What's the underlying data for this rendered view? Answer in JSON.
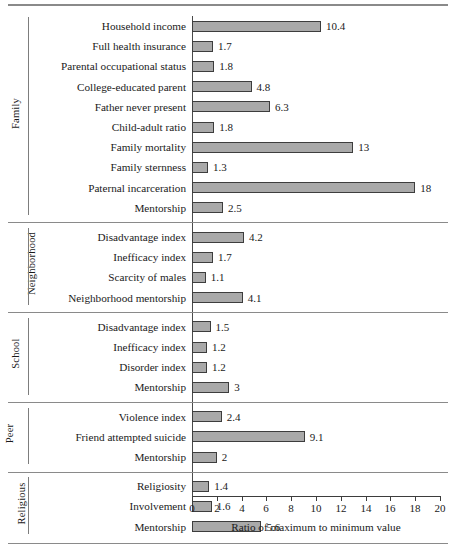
{
  "chart_data": {
    "type": "bar",
    "orientation": "horizontal",
    "title": "",
    "xlabel": "Ratio of maximum to minimum value",
    "ylabel": "",
    "xlim": [
      0,
      20
    ],
    "xticks": [
      0,
      2,
      4,
      6,
      8,
      10,
      12,
      14,
      16,
      18,
      20
    ],
    "grid": false,
    "legend": false,
    "groups": [
      {
        "name": "Family",
        "categories": [
          "Household income",
          "Full health insurance",
          "Parental occupational status",
          "College-educated parent",
          "Father never present",
          "Child-adult ratio",
          "Family mortality",
          "Family sternness",
          "Paternal incarceration",
          "Mentorship"
        ],
        "values": [
          10.4,
          1.7,
          1.8,
          4.8,
          6.3,
          1.8,
          13,
          1.3,
          18,
          2.5
        ],
        "labels": [
          "10.4",
          "1.7",
          "1.8",
          "4.8",
          "6.3",
          "1.8",
          "13",
          "1.3",
          "18",
          "2.5"
        ]
      },
      {
        "name": "Neighborhood",
        "categories": [
          "Disadvantage index",
          "Inefficacy index",
          "Scarcity of males",
          "Neighborhood mentorship"
        ],
        "values": [
          4.2,
          1.7,
          1.1,
          4.1
        ],
        "labels": [
          "4.2",
          "1.7",
          "1.1",
          "4.1"
        ]
      },
      {
        "name": "School",
        "categories": [
          "Disadvantage index",
          "Inefficacy index",
          "Disorder index",
          "Mentorship"
        ],
        "values": [
          1.5,
          1.2,
          1.2,
          3
        ],
        "labels": [
          "1.5",
          "1.2",
          "1.2",
          "3"
        ]
      },
      {
        "name": "Peer",
        "categories": [
          "Violence index",
          "Friend attempted suicide",
          "Mentorship"
        ],
        "values": [
          2.4,
          9.1,
          2
        ],
        "labels": [
          "2.4",
          "9.1",
          "2"
        ]
      },
      {
        "name": "Religious",
        "categories": [
          "Religiosity",
          "Involvement",
          "Mentorship"
        ],
        "values": [
          1.4,
          1.6,
          5.6
        ],
        "labels": [
          "1.4",
          "1.6",
          "5.6"
        ]
      }
    ],
    "colors": {
      "bar_fill": "#a9a9a9",
      "bar_stroke": "#3d3d3d",
      "axis": "#3d3d3d",
      "rule": "#8a8a8a",
      "text": "#1a1a1a"
    }
  }
}
